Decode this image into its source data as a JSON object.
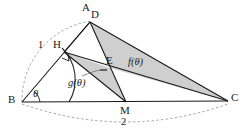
{
  "figure": {
    "type": "geometry-diagram",
    "width": 249,
    "height": 136,
    "background_color": "#ffffff",
    "stroke_color": "#1a1a1a",
    "shade_color": "#c9c9c9",
    "dash_color": "#9a9a9a"
  },
  "vertices": {
    "A": {
      "label": "A",
      "x": 90,
      "y": 22,
      "label_x": 82,
      "label_y": 3
    },
    "D": {
      "label": "D",
      "x": 90,
      "y": 22,
      "label_x": 91,
      "label_y": 10
    },
    "H": {
      "label": "H",
      "x": 64,
      "y": 52,
      "label_x": 53,
      "label_y": 40
    },
    "B": {
      "label": "B",
      "x": 22,
      "y": 102,
      "label_x": 8,
      "label_y": 95
    },
    "C": {
      "label": "C",
      "x": 228,
      "y": 101,
      "label_x": 231,
      "label_y": 93
    },
    "M": {
      "label": "M",
      "x": 126,
      "y": 102,
      "label_x": 121,
      "label_y": 107
    },
    "E": {
      "label": "E",
      "x": 110,
      "y": 68,
      "label_x": 107,
      "label_y": 56
    }
  },
  "measures": {
    "side_bh_label": "1",
    "side_bh_label_x": 38,
    "side_bh_label_y": 41,
    "side_bc_label": "2",
    "side_bc_label_x": 121,
    "side_bc_label_y": 118,
    "angle_label": "θ",
    "angle_label_x": 34,
    "angle_label_y": 90
  },
  "regions": [
    {
      "name": "f-theta-triangle",
      "label": "f(θ)",
      "label_x": 128,
      "label_y": 58,
      "points": "90,22 110,68 228,101",
      "fill": "#cfcfcf"
    },
    {
      "name": "g-theta-triangle",
      "label": "g(θ)",
      "label_x": 69,
      "label_y": 79,
      "points": "64,52 110,68 126,102",
      "fill": "#cfcfcf"
    }
  ],
  "segments": [
    {
      "name": "segment-b-a",
      "x1": 22,
      "y1": 102,
      "x2": 90,
      "y2": 22
    },
    {
      "name": "segment-b-c",
      "x1": 22,
      "y1": 102,
      "x2": 228,
      "y2": 101
    },
    {
      "name": "segment-h-c",
      "x1": 64,
      "y1": 52,
      "x2": 228,
      "y2": 101
    },
    {
      "name": "segment-h-m",
      "x1": 64,
      "y1": 52,
      "x2": 126,
      "y2": 102
    },
    {
      "name": "segment-d-m",
      "x1": 90,
      "y1": 22,
      "x2": 126,
      "y2": 102
    },
    {
      "name": "segment-d-c",
      "x1": 90,
      "y1": 22,
      "x2": 228,
      "y2": 101
    },
    {
      "name": "segment-h-d",
      "x1": 64,
      "y1": 52,
      "x2": 90,
      "y2": 22
    }
  ],
  "arcs": [
    {
      "name": "arc-radius-one-dashed",
      "d": "M 22 102 A 80 80 0 0 1 92 21",
      "style": "dashed"
    },
    {
      "name": "arc-h-to-baseline",
      "d": "M 62 48 A 44 44 0 0 1 69 102",
      "style": "solid"
    },
    {
      "name": "arc-chord-two-dashed",
      "d": "M 22 104 Q 125 140 228 104",
      "style": "dashed"
    }
  ],
  "markers": {
    "right_angle_at_h": {
      "name": "right-angle-marker",
      "points": "63,59 70,62 67,55"
    },
    "angle_arc_at_b": {
      "name": "angle-arc-theta",
      "d": "M 38 102 A 16 16 0 0 0 33 92"
    },
    "g_leader_tick": {
      "name": "g-leader-tick",
      "x1": 100,
      "y1": 70,
      "x2": 106,
      "y2": 70
    },
    "g_leader_curve": {
      "name": "g-leader-curve",
      "d": "M 82 76 Q 94 71 100 70"
    }
  }
}
